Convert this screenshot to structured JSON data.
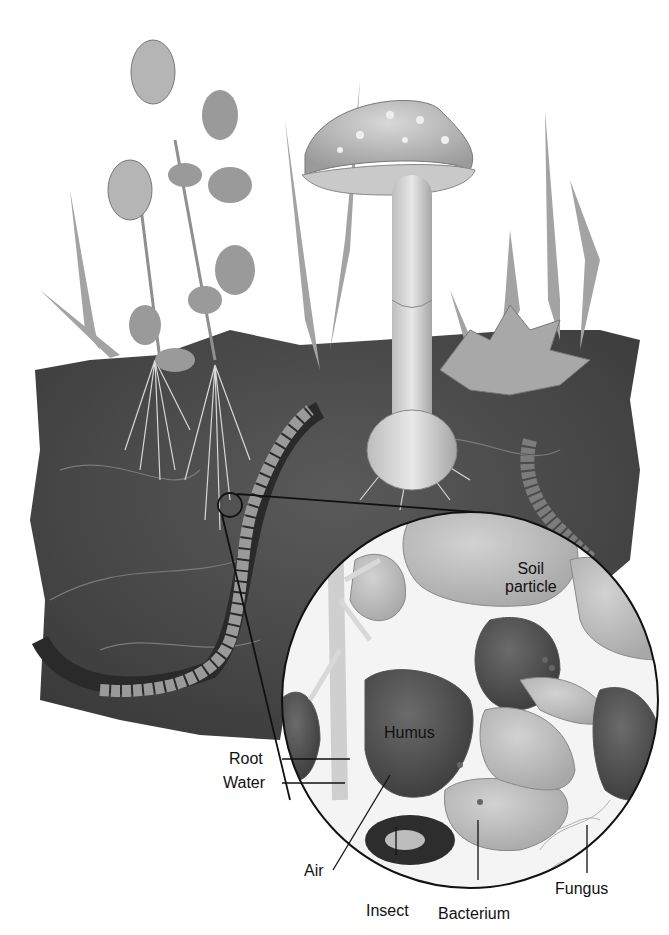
{
  "diagram": {
    "elements": [
      {
        "id": "clover",
        "kind": "plant"
      },
      {
        "id": "grass",
        "kind": "plant"
      },
      {
        "id": "mushroom",
        "kind": "fungus"
      },
      {
        "id": "leaf",
        "kind": "leaf-litter"
      },
      {
        "id": "earthworm",
        "kind": "animal"
      },
      {
        "id": "larva",
        "kind": "animal"
      },
      {
        "id": "magnifier-circle",
        "kind": "inset"
      }
    ]
  },
  "labels": {
    "soil_particle_line1": "Soil",
    "soil_particle_line2": "particle",
    "humus": "Humus",
    "root": "Root",
    "water": "Water",
    "air": "Air",
    "insect": "Insect",
    "bacterium": "Bacterium",
    "fungus": "Fungus"
  },
  "colors": {
    "soil": "#4a4a4a",
    "soil_dark": "#333333",
    "particle": "#b9b9b9",
    "humus": "#4f4f4f",
    "plant": "#9a9a9a",
    "line": "#111111"
  }
}
